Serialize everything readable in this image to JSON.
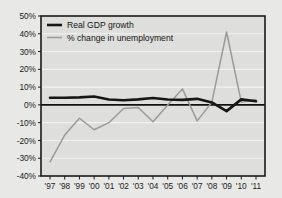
{
  "figure": {
    "background_color": "#e8e8e6",
    "plot_background_color": "#dededc",
    "frame_color": "#1a1a1a",
    "gridline_color": "#f2f2f0"
  },
  "legend": {
    "position": "top-left-inside",
    "entries": [
      {
        "label": "Real GDP growth",
        "color": "#161616",
        "width": 2.6
      },
      {
        "label": "% change in unemployment",
        "color": "#9a9a9a",
        "width": 1.5
      }
    ]
  },
  "axes": {
    "y": {
      "label": "",
      "min": -40,
      "max": 50,
      "step": 10,
      "suffix": "%",
      "ticks": [
        "50%",
        "40%",
        "30%",
        "20%",
        "10%",
        "0%",
        "-10%",
        "-20%",
        "-30%",
        "-40%"
      ],
      "tick_values": [
        50,
        40,
        30,
        20,
        10,
        0,
        -10,
        -20,
        -30,
        -40
      ]
    },
    "x": {
      "label": "",
      "ticks": [
        "'97",
        "'98",
        "'99",
        "'00",
        "'01",
        "'02",
        "'03",
        "'04",
        "'05",
        "'06",
        "'07",
        "'08",
        "'09",
        "'10",
        "'11"
      ]
    }
  },
  "chart_data": {
    "type": "line",
    "title": "",
    "subtitle": "",
    "xlabel": "",
    "ylabel": "",
    "xlim": [
      1997,
      2011
    ],
    "ylim": [
      -40,
      50
    ],
    "grid": true,
    "legend_position": "upper left",
    "categories": [
      "'97",
      "'98",
      "'99",
      "'00",
      "'01",
      "'02",
      "'03",
      "'04",
      "'05",
      "'06",
      "'07",
      "'08",
      "'09",
      "'10",
      "'11"
    ],
    "x": [
      1997,
      1998,
      1999,
      2000,
      2001,
      2002,
      2003,
      2004,
      2005,
      2006,
      2007,
      2008,
      2009,
      2010,
      2011
    ],
    "series": [
      {
        "name": "Real GDP growth",
        "color": "#161616",
        "linewidth": 2.6,
        "values": [
          4.0,
          4.0,
          4.2,
          4.7,
          3.0,
          2.6,
          3.1,
          3.9,
          3.0,
          2.8,
          3.4,
          1.4,
          -3.5,
          3.1,
          2.0
        ]
      },
      {
        "name": "% change in unemployment",
        "color": "#9a9a9a",
        "linewidth": 1.5,
        "values": [
          -32.0,
          -17.0,
          -7.5,
          -14.0,
          -10.0,
          -2.0,
          -1.5,
          -9.5,
          0.0,
          9.0,
          -9.0,
          1.5,
          41.0,
          1.5,
          3.0
        ]
      }
    ],
    "annotations": [
      {
        "text": "zero-line",
        "y": 0
      }
    ]
  }
}
